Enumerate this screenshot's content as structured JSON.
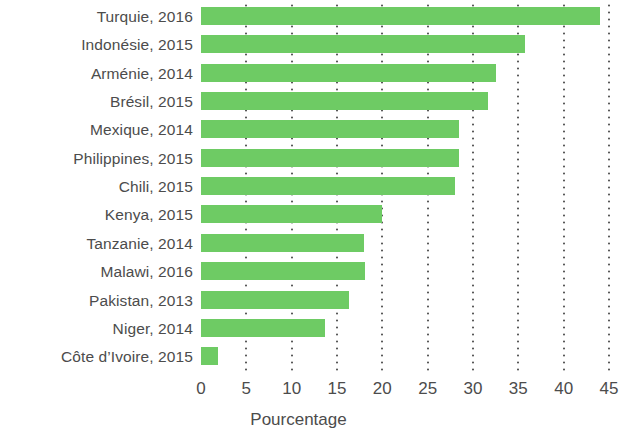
{
  "chart_data": {
    "type": "bar",
    "orientation": "horizontal",
    "title": "",
    "xlabel": "Pourcentage",
    "ylabel": "",
    "xlim": [
      0,
      45
    ],
    "xticks": [
      0,
      5,
      10,
      15,
      20,
      25,
      30,
      35,
      40,
      45
    ],
    "xticklabels": [
      "0",
      "5",
      "10",
      "15",
      "20",
      "25",
      "30",
      "35",
      "40",
      "45"
    ],
    "grid": "vertical-dotted",
    "legend": null,
    "bar_color": "#6ecb64",
    "text_color": "#4c4c4c",
    "categories": [
      "Turquie, 2016",
      "Indonésie, 2015",
      "Arménie, 2014",
      "Brésil, 2015",
      "Mexique, 2014",
      "Philippines, 2015",
      "Chili, 2015",
      "Kenya, 2015",
      "Tanzanie, 2014",
      "Malawi, 2016",
      "Pakistan, 2013",
      "Niger, 2014",
      "Côte d’Ivoire, 2015"
    ],
    "values": [
      44.0,
      35.7,
      32.5,
      31.7,
      28.5,
      28.5,
      28.0,
      20.0,
      18.0,
      18.1,
      16.3,
      13.7,
      1.9
    ]
  }
}
